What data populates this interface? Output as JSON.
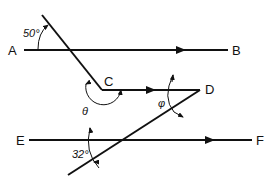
{
  "diagram": {
    "type": "geometry-parallel-lines",
    "points": {
      "A": "A",
      "B": "B",
      "C": "C",
      "D": "D",
      "E": "E",
      "F": "F"
    },
    "angles": {
      "top": "50°",
      "theta": "θ",
      "phi": "φ",
      "bottom": "32°"
    },
    "colors": {
      "stroke": "#111111",
      "background": "#ffffff"
    }
  }
}
